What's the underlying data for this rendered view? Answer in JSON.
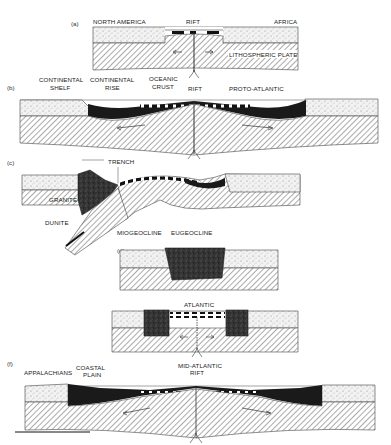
{
  "figure": {
    "colors": {
      "sediment": "#efefef",
      "lithosphere_hatch": "#555555",
      "ocean_crust": "#111111",
      "granite": "#2a2a2a",
      "line": "#222222"
    },
    "panels": [
      {
        "id": "a",
        "tag": "(a)",
        "labels": {
          "left": "NORTH AMERICA",
          "center": "RIFT",
          "right": "AFRICA",
          "plate": "LITHOSPHERIC PLATE"
        }
      },
      {
        "id": "b",
        "tag": "(b)",
        "labels": {
          "shelf_1": "CONTINENTAL",
          "shelf_2": "SHELF",
          "rise_1": "CONTINENTAL",
          "rise_2": "RISE",
          "crust_1": "OCEANIC",
          "crust_2": "CRUST",
          "rift": "RIFT",
          "ocean": "PROTO-ATLANTIC"
        }
      },
      {
        "id": "c",
        "tag": "(c)",
        "labels": {
          "trench": "TRENCH",
          "granite": "GRANITE",
          "dunite": "DUNITE"
        }
      },
      {
        "id": "d",
        "tag": "(d)",
        "labels": {
          "miogeocline": "MIOGEOCLINE",
          "eugeocline": "EUGEOCLINE"
        }
      },
      {
        "id": "e",
        "tag": "(e)",
        "labels": {
          "ocean": "ATLANTIC"
        }
      },
      {
        "id": "f",
        "tag": "(f)",
        "labels": {
          "mountains": "APPALACHIANS",
          "plain_1": "COASTAL",
          "plain_2": "PLAIN",
          "rift_1": "MID-ATLANTIC",
          "rift_2": "RIFT"
        }
      }
    ]
  }
}
